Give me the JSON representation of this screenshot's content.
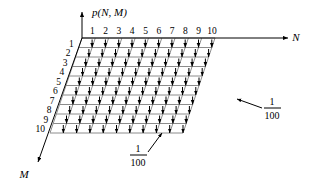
{
  "figure": {
    "name": "joint-pmf-uniform-grid",
    "vertical_axis_label": "p(N, M)",
    "n_axis_label": "N",
    "m_axis_label": "M",
    "n_ticks": [
      "1",
      "2",
      "3",
      "4",
      "5",
      "6",
      "7",
      "8",
      "9",
      "10"
    ],
    "m_ticks": [
      "1",
      "2",
      "3",
      "4",
      "5",
      "6",
      "7",
      "8",
      "9",
      "10"
    ],
    "callouts": [
      {
        "numerator": "1",
        "denominator": "100"
      },
      {
        "numerator": "1",
        "denominator": "100"
      }
    ],
    "colors": {
      "grid": "#8c8c8c",
      "axis": "#000000",
      "arrow": "#000000",
      "text": "#000000",
      "background": "#ffffff"
    }
  },
  "chart_data": {
    "type": "scatter",
    "title": "",
    "xlabel": "N",
    "ylabel": "M",
    "zlabel": "p(N, M)",
    "x": [
      1,
      2,
      3,
      4,
      5,
      6,
      7,
      8,
      9,
      10
    ],
    "y": [
      1,
      2,
      3,
      4,
      5,
      6,
      7,
      8,
      9,
      10
    ],
    "xlim": [
      1,
      10
    ],
    "ylim": [
      1,
      10
    ],
    "grid": true,
    "value_per_point": 0.01,
    "value_label": "1/100",
    "n_points": 100
  }
}
